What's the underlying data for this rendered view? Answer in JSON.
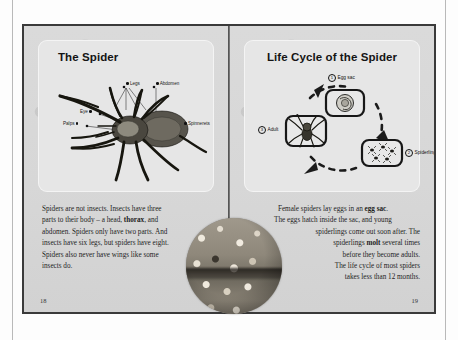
{
  "spread": {
    "left_page": {
      "title": "The Spider",
      "folio": "18",
      "diagram": {
        "name": "spider-anatomy-diagram",
        "labels": [
          {
            "id": "legs",
            "text": "Legs"
          },
          {
            "id": "abdomen",
            "text": "Abdomen"
          },
          {
            "id": "eye",
            "text": "Eye"
          },
          {
            "id": "palps",
            "text": "Palps"
          },
          {
            "id": "spinnerets",
            "text": "Spinnerets"
          }
        ]
      },
      "body": {
        "line1": "Spiders are not insects. Insects have three",
        "line2_a": "parts to their body – a head, ",
        "line2_bold": "thorax",
        "line2_b": ", and",
        "line3": "abdomen. Spiders only have two parts. And",
        "line4": "insects have six legs, but spiders have eight.",
        "line5": "Spiders also never have wings like some",
        "line6": "insects do."
      }
    },
    "right_page": {
      "title": "Life Cycle of the Spider",
      "folio": "19",
      "diagram": {
        "name": "spider-life-cycle-diagram",
        "stages": [
          {
            "number": "1",
            "text": "Egg sac"
          },
          {
            "number": "2",
            "text": "Spiderlings"
          },
          {
            "number": "3",
            "text": "Adult"
          }
        ]
      },
      "body": {
        "line1_a": "Female spiders lay eggs in an ",
        "line1_bold": "egg sac",
        "line1_b": ".",
        "line2": "The eggs hatch inside the sac, and young",
        "line3": "spiderlings come out soon after. The",
        "line4_a": "spiderlings ",
        "line4_bold": "molt",
        "line4_b": " several times",
        "line5": "before they become adults.",
        "line6": "The life cycle of most spiders",
        "line7": "takes less than 12 months."
      },
      "photo_caption": ""
    }
  },
  "colors": {
    "page_background": "#d9d9d9",
    "panel_background": "#e6e6e6",
    "ink": "#1a1a1a",
    "border": "#3a3a3a"
  }
}
